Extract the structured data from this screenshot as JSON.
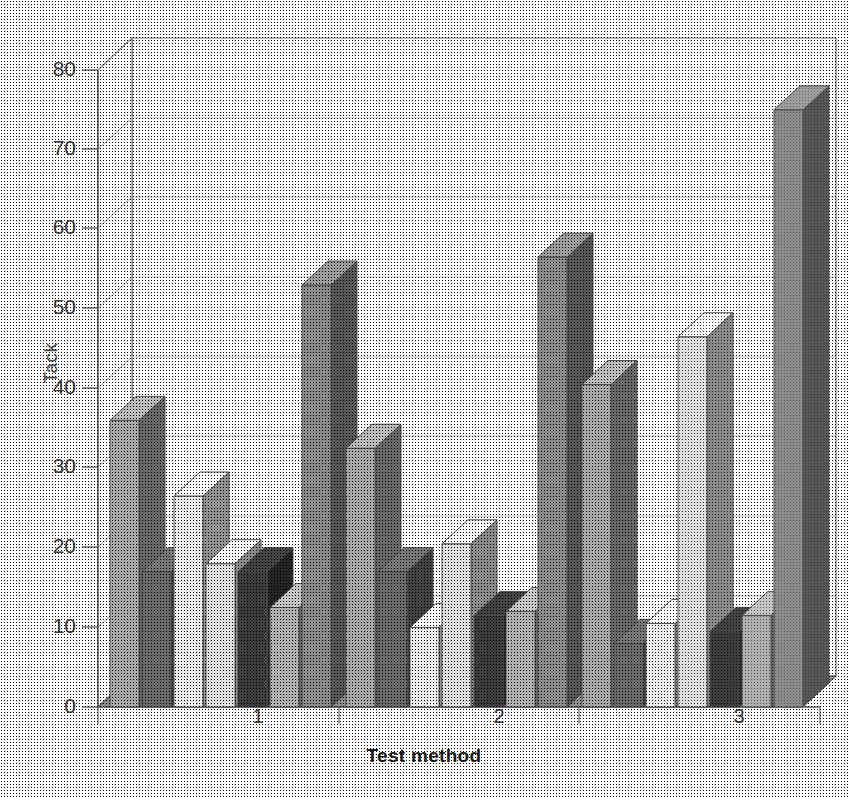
{
  "chart_data": {
    "type": "bar",
    "title": "",
    "subtitle": "",
    "xlabel": "Test method",
    "ylabel": "Tack",
    "categories": [
      "1",
      "2",
      "3"
    ],
    "ylim": [
      0,
      80
    ],
    "yticks": [
      0,
      10,
      20,
      30,
      40,
      50,
      60,
      70,
      80
    ],
    "ytick_labels": [
      "0",
      "10",
      "20",
      "30",
      "40",
      "50",
      "60",
      "70",
      "80"
    ],
    "grid": true,
    "legend": "none",
    "style": "3d-grouped-bars-grayscale",
    "series": [
      {
        "name": "Series 1",
        "color": "#a8a8a8",
        "values": [
          36,
          32.5,
          40.5
        ]
      },
      {
        "name": "Series 2",
        "color": "#6a6a6a",
        "values": [
          17,
          17,
          8
        ]
      },
      {
        "name": "Series 3",
        "color": "#ececec",
        "values": [
          26.5,
          10,
          10.5
        ]
      },
      {
        "name": "Series 4",
        "color": "#e0e0e0",
        "values": [
          18,
          20.5,
          46.5
        ]
      },
      {
        "name": "Series 5",
        "color": "#3c3c3c",
        "values": [
          17,
          11.5,
          9.5
        ]
      },
      {
        "name": "Series 6",
        "color": "#b0b0b0",
        "values": [
          12.5,
          12,
          11.5
        ]
      },
      {
        "name": "Series 7",
        "color": "#8c8c8c",
        "values": [
          53,
          56.5,
          75
        ]
      }
    ]
  },
  "axes": {
    "y_label": "Tack",
    "x_label": "Test method",
    "y_tick_labels": [
      "80",
      "70",
      "60",
      "50",
      "40",
      "30",
      "20",
      "10",
      "0"
    ],
    "x_tick_labels": [
      "1",
      "2",
      "3"
    ]
  },
  "colors": {
    "background": "#ffffff",
    "gridline": "#b9b9b9",
    "frame": "#6f6f6f",
    "floor": "#8f8f8f",
    "text": "#3a3a3a"
  }
}
